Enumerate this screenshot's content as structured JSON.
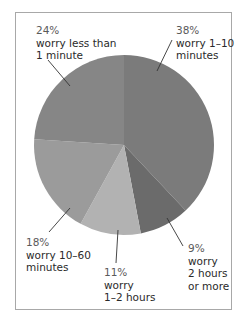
{
  "chart_data": {
    "type": "pie",
    "title": "",
    "start_angle_deg": 0,
    "direction": "clockwise",
    "slices": [
      {
        "label": "worry 1–10 minutes",
        "percent": 38,
        "value": 38,
        "color": "#7b7b7b"
      },
      {
        "label": "worry 2 hours or more",
        "percent": 9,
        "value": 9,
        "color": "#6b6b6b"
      },
      {
        "label": "worry 1–2 hours",
        "percent": 11,
        "value": 11,
        "color": "#b2b2b2"
      },
      {
        "label": "worry 10–60 minutes",
        "percent": 18,
        "value": 18,
        "color": "#9b9b9b"
      },
      {
        "label": "worry less than 1 minute",
        "percent": 24,
        "value": 24,
        "color": "#868686"
      }
    ],
    "legend": "none (direct labels with leader lines)"
  },
  "labels": {
    "s1": {
      "pct": "38%",
      "line1": "worry 1–10",
      "line2": "minutes"
    },
    "s2": {
      "pct": "9%",
      "line1": "worry",
      "line2": "2 hours",
      "line3": "or more"
    },
    "s3": {
      "pct": "11%",
      "line1": "worry",
      "line2": "1–2 hours"
    },
    "s4": {
      "pct": "18%",
      "line1": "worry 10–60",
      "line2": "minutes"
    },
    "s5": {
      "pct": "24%",
      "line1": "worry less than",
      "line2": "1 minute"
    }
  }
}
